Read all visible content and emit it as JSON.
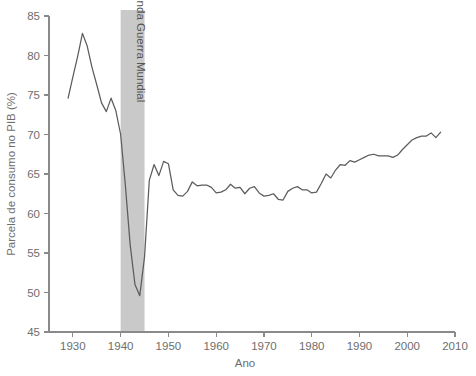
{
  "chart_data": {
    "type": "line",
    "title": "",
    "xlabel": "Ano",
    "ylabel": "Parcela de consumo no PIB (%)",
    "xlim": [
      1925,
      2010
    ],
    "ylim": [
      45,
      85
    ],
    "xticks": [
      1930,
      1940,
      1950,
      1960,
      1970,
      1980,
      1990,
      2000,
      2010
    ],
    "yticks": [
      45,
      50,
      55,
      60,
      65,
      70,
      75,
      80,
      85
    ],
    "grid": false,
    "legend": null,
    "line_color": "#5c5c5c",
    "annotations": [
      {
        "type": "vspan",
        "label": "Segunda Guerra Mundial",
        "x_start": 1940,
        "x_end": 1945,
        "color": "#c9c9c9",
        "orientation": "vertical"
      }
    ],
    "series": [
      {
        "name": "Parcela de consumo no PIB",
        "x": [
          1929,
          1930,
          1931,
          1932,
          1933,
          1934,
          1935,
          1936,
          1937,
          1938,
          1939,
          1940,
          1941,
          1942,
          1943,
          1944,
          1945,
          1946,
          1947,
          1948,
          1949,
          1950,
          1951,
          1952,
          1953,
          1954,
          1955,
          1956,
          1957,
          1958,
          1959,
          1960,
          1961,
          1962,
          1963,
          1964,
          1965,
          1966,
          1967,
          1968,
          1969,
          1970,
          1971,
          1972,
          1973,
          1974,
          1975,
          1976,
          1977,
          1978,
          1979,
          1980,
          1981,
          1982,
          1983,
          1984,
          1985,
          1986,
          1987,
          1988,
          1989,
          1990,
          1991,
          1992,
          1993,
          1994,
          1995,
          1996,
          1997,
          1998,
          1999,
          2000,
          2001,
          2002,
          2003,
          2004,
          2005,
          2006,
          2007
        ],
        "y": [
          74.6,
          77.3,
          79.9,
          82.8,
          81.2,
          78.5,
          76.3,
          74.0,
          72.9,
          74.6,
          73.0,
          70.0,
          63.5,
          56.0,
          51.0,
          49.6,
          54.5,
          64.2,
          66.2,
          64.8,
          66.6,
          66.3,
          63.0,
          62.3,
          62.2,
          62.8,
          64.0,
          63.5,
          63.6,
          63.6,
          63.3,
          62.6,
          62.7,
          63.0,
          63.7,
          63.2,
          63.3,
          62.5,
          63.2,
          63.4,
          62.6,
          62.2,
          62.3,
          62.5,
          61.8,
          61.7,
          62.8,
          63.2,
          63.4,
          63.0,
          63.0,
          62.6,
          62.7,
          63.8,
          65.0,
          64.5,
          65.5,
          66.2,
          66.1,
          66.7,
          66.5,
          66.8,
          67.1,
          67.4,
          67.5,
          67.3,
          67.3,
          67.3,
          67.1,
          67.4,
          68.1,
          68.7,
          69.3,
          69.6,
          69.8,
          69.8,
          70.2,
          69.6,
          70.3
        ]
      }
    ]
  },
  "plot_geometry": {
    "left": 49,
    "right": 455,
    "top": 16,
    "bottom": 332
  },
  "axis_label_x": "Ano",
  "axis_label_y": "Parcela de consumo no PIB (%)",
  "band_label": "Segunda Guerra Mundial"
}
